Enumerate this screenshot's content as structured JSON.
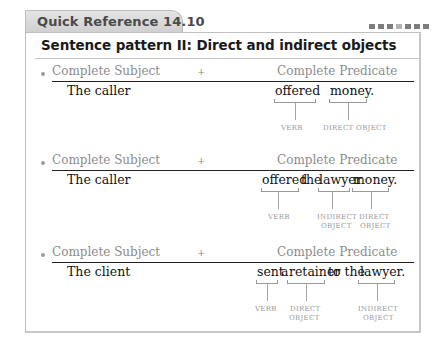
{
  "header": {
    "tab_label": "Quick Reference 14.10",
    "title": "Sentence pattern II: Direct and indirect objects",
    "dots": [
      "dark",
      "dark",
      "dark",
      "light",
      "dark",
      "dark",
      "dark"
    ]
  },
  "columns": {
    "subject": "Complete Subject",
    "plus": "+",
    "predicate": "Complete Predicate"
  },
  "examples": [
    {
      "subject": "The caller",
      "predicate_words": [
        "offered",
        "money."
      ],
      "labels": [
        "VERB",
        "DIRECT OBJECT"
      ]
    },
    {
      "subject": "The caller",
      "predicate_words": [
        "offered",
        "the",
        "lawyer",
        "money."
      ],
      "labels": [
        "VERB",
        "INDIRECT",
        "OBJECT",
        "DIRECT",
        "OBJECT"
      ]
    },
    {
      "subject": "The client",
      "predicate_words": [
        "sent",
        "a",
        "retainer",
        "to the",
        "lawyer."
      ],
      "labels": [
        "VERB",
        "DIRECT",
        "OBJECT",
        "INDIRECT",
        "OBJECT"
      ]
    }
  ]
}
